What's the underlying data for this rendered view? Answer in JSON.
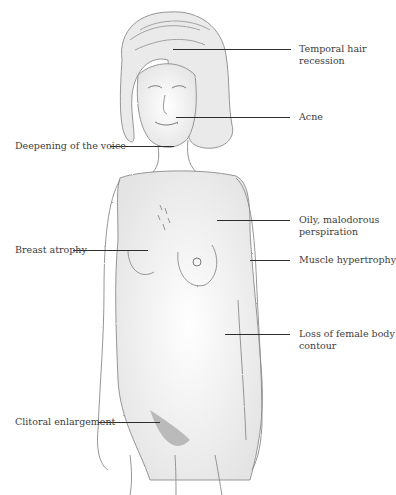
{
  "diagram": {
    "style": "pencil sketch, grayscale",
    "colors": {
      "background": "#ffffff",
      "line": "#2e2e2e",
      "text": "#3d3d3d",
      "shading": "#9a9a9a"
    },
    "labels": [
      {
        "id": "temporal-hair-recession",
        "lines": [
          "Temporal hair",
          "recession"
        ],
        "side": "right"
      },
      {
        "id": "acne",
        "lines": [
          "Acne"
        ],
        "side": "right"
      },
      {
        "id": "deepening-voice",
        "lines": [
          "Deepening of the voice"
        ],
        "side": "left"
      },
      {
        "id": "oily-perspiration",
        "lines": [
          "Oily, malodorous",
          "perspiration"
        ],
        "side": "right"
      },
      {
        "id": "breast-atrophy",
        "lines": [
          "Breast atrophy"
        ],
        "side": "left"
      },
      {
        "id": "muscle-hypertrophy",
        "lines": [
          "Muscle hypertrophy"
        ],
        "side": "right"
      },
      {
        "id": "loss-body-contour",
        "lines": [
          "Loss of female body",
          "contour"
        ],
        "side": "right"
      },
      {
        "id": "clitoral-enlargement",
        "lines": [
          "Clitoral enlargement"
        ],
        "side": "left"
      }
    ]
  }
}
